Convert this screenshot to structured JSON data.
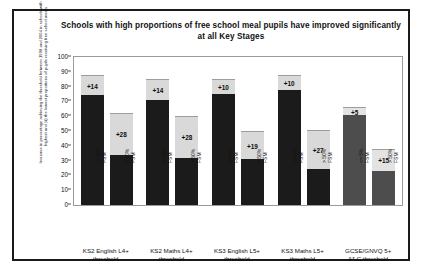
{
  "chart_data": {
    "type": "bar",
    "title": "Schools with high proportions of free school meal pupils have improved significantly at all Key Stages",
    "ylabel": "Increase in percentage achieving the threshold between 1998 and 2004 in schools with (i) the highest and (ii) the lowest proportions of pupils receiving free school meals",
    "xlabel": "",
    "ylim": [
      0,
      100
    ],
    "yticks": [
      0,
      10,
      20,
      30,
      40,
      50,
      60,
      70,
      80,
      90,
      100
    ],
    "grid": false,
    "legend": "none",
    "stacked": true,
    "groups": [
      {
        "label_line1": "KS2 English L4+",
        "label_line2": "threshold",
        "bars": [
          {
            "sub_line1": "<= 8%",
            "sub_line2": "FSM",
            "base": 74,
            "increase": 14,
            "total": 88,
            "data_label": "+14",
            "shade": "dark"
          },
          {
            "sub_line1": "> 50%",
            "sub_line2": "FSM",
            "base": 34,
            "increase": 28,
            "total": 62,
            "data_label": "+28",
            "shade": "dark"
          }
        ]
      },
      {
        "label_line1": "KS2 Maths L4+",
        "label_line2": "threshold",
        "bars": [
          {
            "sub_line1": "<= 8%",
            "sub_line2": "FSM",
            "base": 71,
            "increase": 14,
            "total": 85,
            "data_label": "+14",
            "shade": "dark"
          },
          {
            "sub_line1": "> 50%",
            "sub_line2": "FSM",
            "base": 32,
            "increase": 28,
            "total": 60,
            "data_label": "+28",
            "shade": "dark"
          }
        ]
      },
      {
        "label_line1": "KS3 English L5+",
        "label_line2": "threshold",
        "bars": [
          {
            "sub_line1": "<= 5%",
            "sub_line2": "FSM",
            "base": 75,
            "increase": 10,
            "total": 85,
            "data_label": "+10",
            "shade": "dark"
          },
          {
            "sub_line1": "> 50%",
            "sub_line2": "FSM",
            "base": 31,
            "increase": 19,
            "total": 50,
            "data_label": "+19",
            "shade": "dark"
          }
        ]
      },
      {
        "label_line1": "KS3 Maths L5+",
        "label_line2": "threshold",
        "bars": [
          {
            "sub_line1": "<= 5%",
            "sub_line2": "FSM",
            "base": 78,
            "increase": 10,
            "total": 88,
            "data_label": "+10",
            "shade": "dark"
          },
          {
            "sub_line1": "> 50%",
            "sub_line2": "FSM",
            "base": 24,
            "increase": 27,
            "total": 51,
            "data_label": "+27",
            "shade": "dark"
          }
        ]
      },
      {
        "label_line1": "GCSE/GNVQ 5+",
        "label_line2": "A*-C threshold",
        "bars": [
          {
            "sub_line1": "<= 5%",
            "sub_line2": "FSM",
            "base": 61,
            "increase": 5,
            "total": 66,
            "data_label": "+5",
            "shade": "alt"
          },
          {
            "sub_line1": "> 50%",
            "sub_line2": "FSM",
            "base": 23,
            "increase": 15,
            "total": 38,
            "data_label": "+15",
            "shade": "alt"
          }
        ]
      }
    ],
    "colors": {
      "base_dark": "#1b1b1b",
      "base_alt": "#4d4d4d",
      "increase_light": "#d9d9d9",
      "border": "#1a1a1a",
      "text": "#111111"
    }
  }
}
